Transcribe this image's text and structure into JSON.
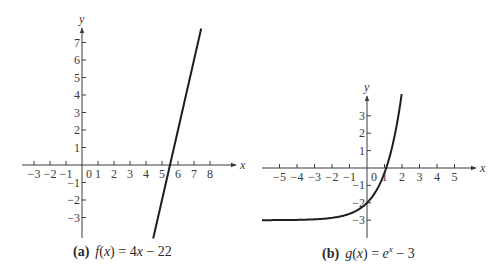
{
  "chart_data": [
    {
      "type": "line",
      "panel": "a",
      "title": "(a) f(x) = 4x − 22",
      "caption_tag": "(a)",
      "caption_formula": "f(x) = 4x − 22",
      "xlabel": "x",
      "ylabel": "y",
      "xlim": [
        -3.5,
        9.5
      ],
      "ylim": [
        -4,
        8
      ],
      "x_ticks": [
        -3,
        -2,
        -1,
        0,
        1,
        2,
        3,
        4,
        5,
        6,
        7,
        8
      ],
      "y_ticks": [
        -3,
        -2,
        -1,
        1,
        2,
        3,
        4,
        5,
        6,
        7
      ],
      "grid": false,
      "series": [
        {
          "name": "f(x) = 4x − 22",
          "x": [
            4.5,
            5.5,
            6.5,
            7.45
          ],
          "y": [
            -4,
            0,
            4,
            7.8
          ]
        }
      ]
    },
    {
      "type": "line",
      "panel": "b",
      "title": "(b) g(x) = e^x − 3",
      "caption_tag": "(b)",
      "caption_formula": "g(x) = e^x − 3",
      "xlabel": "x",
      "ylabel": "y",
      "xlim": [
        -6,
        6.3
      ],
      "ylim": [
        -4,
        4.2
      ],
      "x_ticks": [
        -5,
        -4,
        -3,
        -2,
        -1,
        0,
        1,
        2,
        3,
        4,
        5
      ],
      "y_ticks": [
        -3,
        -2,
        -1,
        1,
        2,
        3
      ],
      "grid": false,
      "series": [
        {
          "name": "g(x) = e^x − 3",
          "x": [
            -6,
            -5,
            -4,
            -3,
            -2,
            -1,
            0,
            0.5,
            1,
            1.1,
            1.5,
            2
          ],
          "y": [
            -2.998,
            -2.993,
            -2.982,
            -2.95,
            -2.865,
            -2.632,
            -2,
            -1.351,
            -0.282,
            0,
            1.482,
            4.389
          ]
        }
      ]
    }
  ],
  "captions": {
    "a_tag": "(a)",
    "a_formula_name": "f",
    "a_formula_arg": "x",
    "a_formula_rest": " = 4",
    "a_formula_var": "x",
    "a_formula_tail": " − 22",
    "b_tag": "(b)",
    "b_formula_name": "g",
    "b_formula_arg": "x",
    "b_formula_eq": " = ",
    "b_formula_base": "e",
    "b_formula_exp": "x",
    "b_formula_tail": " − 3"
  },
  "colors": {
    "axis": "#3a3a3a",
    "curve": "#1e1e1e",
    "background": "#ffffff"
  }
}
